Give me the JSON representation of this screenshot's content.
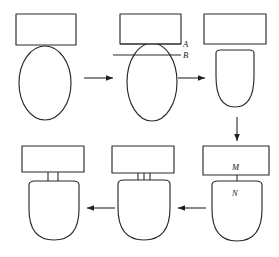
{
  "figure": {
    "type": "process-flow-diagram",
    "background_color": "#ffffff",
    "stroke_color": "#2b2b2b",
    "arrow_color": "#1f1f1f",
    "panel_count": 6,
    "label_style": "italic-serif"
  },
  "labels": {
    "a": "A",
    "b": "B",
    "m": "M",
    "n": "N"
  },
  "panels": [
    {
      "id": "panel-1",
      "position": "top-left",
      "description": "rectangle resting tangent on top of ellipse"
    },
    {
      "id": "panel-2",
      "position": "top-center",
      "description": "ellipse pressed up into rectangle with reference lines A and B"
    },
    {
      "id": "panel-3",
      "position": "top-right",
      "description": "rectangle separated above flat-topped oval"
    },
    {
      "id": "panel-4",
      "position": "bottom-right",
      "description": "rectangle joined to oval by single connector, labelled M and N"
    },
    {
      "id": "panel-5",
      "position": "bottom-center",
      "description": "rectangle joined to oval by narrow three-line neck"
    },
    {
      "id": "panel-6",
      "position": "bottom-left",
      "description": "rectangle joined to oval by wider two-line neck"
    }
  ],
  "arrows": [
    {
      "id": "arrow-1",
      "direction": "right",
      "from": "panel-1",
      "to": "panel-2"
    },
    {
      "id": "arrow-2",
      "direction": "right",
      "from": "panel-2",
      "to": "panel-3"
    },
    {
      "id": "arrow-3",
      "direction": "down",
      "from": "panel-3",
      "to": "panel-4"
    },
    {
      "id": "arrow-4",
      "direction": "left",
      "from": "panel-4",
      "to": "panel-5"
    },
    {
      "id": "arrow-5",
      "direction": "left",
      "from": "panel-5",
      "to": "panel-6"
    }
  ]
}
